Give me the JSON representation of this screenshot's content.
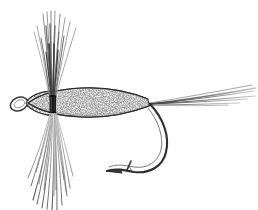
{
  "illustration": {
    "title": "Artificial fishing fly (dry fly) line drawing",
    "subject_name": "fishing-fly",
    "style": "pen-and-ink stipple line art",
    "canvas": {
      "width": 258,
      "height": 210,
      "background": "#ffffff"
    },
    "colors": {
      "ink": "#2b2b2b",
      "ink_light": "#6a6a6a",
      "ink_mid": "#4a4a4a",
      "hook_steel": "#3a3a3a",
      "body_fill": "#f2f2f2",
      "stipple": "#3d3d3d",
      "thread_wrap": "#1c1c1c",
      "background": "#ffffff"
    },
    "parts": [
      {
        "name": "hook-eye",
        "label": "Hook eye",
        "cx": 19,
        "cy": 103,
        "rx": 8.5,
        "ry": 6.5,
        "rotation": -22
      },
      {
        "name": "fly-head",
        "label": "Head",
        "x_start": 26,
        "x_end": 50,
        "center_y": 102
      },
      {
        "name": "fly-body",
        "label": "Dubbed body",
        "x_start": 28,
        "x_end": 149,
        "center_y": 102,
        "max_half_height": 12
      },
      {
        "name": "thread-wrap",
        "label": "Thread wrap",
        "x": 49,
        "y": 96,
        "width": 7,
        "height": 16
      },
      {
        "name": "hackle-upper",
        "label": "Upper hackle fibers",
        "fiber_count": 17,
        "origin_x": 52,
        "origin_y": 104,
        "top_y": 10
      },
      {
        "name": "hackle-lower",
        "label": "Lower hackle fibers",
        "fiber_count": 19,
        "origin_x": 53,
        "origin_y": 104,
        "bottom_y": 210
      },
      {
        "name": "tail-fibers",
        "label": "Tail fibers",
        "fiber_count": 6,
        "origin_x": 148,
        "origin_y": 104,
        "tip_x": 256
      },
      {
        "name": "hook-shank",
        "label": "Hook shank",
        "x_start": 26,
        "x_end": 150,
        "y": 104
      },
      {
        "name": "hook-bend",
        "label": "Hook bend",
        "apex_x": 166,
        "apex_y": 158
      },
      {
        "name": "hook-point",
        "label": "Hook point",
        "tip_x": 107,
        "tip_y": 171
      },
      {
        "name": "hook-barb",
        "label": "Barb",
        "x": 128,
        "y": 163
      }
    ]
  }
}
